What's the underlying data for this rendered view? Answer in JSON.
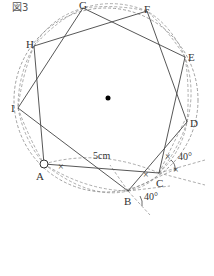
{
  "figure": {
    "title": "図3",
    "length_label": "5cm",
    "angle_label_1": "40°",
    "angle_label_2": "40°",
    "equal_mark": "×"
  },
  "vertices": [
    {
      "name": "A",
      "x": 44,
      "y": 164,
      "lx": 36,
      "ly": 180
    },
    {
      "name": "B",
      "x": 128,
      "y": 191,
      "lx": 124,
      "ly": 205
    },
    {
      "name": "C",
      "x": 159,
      "y": 173,
      "lx": 156,
      "ly": 187
    },
    {
      "name": "D",
      "x": 187,
      "y": 122,
      "lx": 190,
      "ly": 127
    },
    {
      "name": "E",
      "x": 185,
      "y": 57,
      "lx": 188,
      "ly": 61
    },
    {
      "name": "F",
      "x": 147,
      "y": 11,
      "lx": 144,
      "ly": 12
    },
    {
      "name": "G",
      "x": 83,
      "y": 8,
      "lx": 78,
      "ly": 9
    },
    {
      "name": "H",
      "x": 34,
      "y": 46,
      "lx": 26,
      "ly": 46
    },
    {
      "name": "I",
      "x": 18,
      "y": 108,
      "lx": 12,
      "ly": 112
    }
  ],
  "center": {
    "x": 108,
    "y": 98
  },
  "colors": {
    "line": "#444444",
    "dash": "#777777",
    "dot": "#000000"
  }
}
